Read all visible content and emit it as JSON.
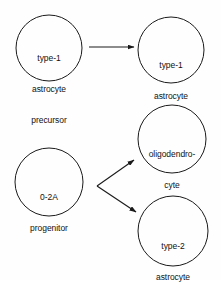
{
  "diagram": {
    "type": "cell-lineage-flow-diagram",
    "background_color": "#fefefe",
    "stroke_color": "#1a1a1a",
    "text_color": "#111111",
    "nodes": [
      {
        "id": "type-1-astrocyte-precursor",
        "label_lines": [
          "type-1",
          "astrocyte",
          "precursor"
        ],
        "line1": "type-1",
        "line2": "astrocyte",
        "line3": "precursor",
        "cx": 49,
        "cy": 48,
        "r": 33
      },
      {
        "id": "type-1-astrocyte",
        "label_lines": [
          "type-1",
          "astrocyte"
        ],
        "line1": "type-1",
        "line2": "astrocyte",
        "cx": 171,
        "cy": 50,
        "r": 33
      },
      {
        "id": "o-2a-progenitor",
        "label_lines": [
          "0-2A",
          "progenitor"
        ],
        "line1": "0-2A",
        "line2": "progenitor",
        "cx": 49,
        "cy": 182,
        "r": 34
      },
      {
        "id": "oligodendrocyte",
        "label_lines": [
          "oligodendro-",
          "cyte"
        ],
        "line1": "oligodendro-",
        "line2": "cyte",
        "cx": 172,
        "cy": 139,
        "r": 34
      },
      {
        "id": "type-2-astrocyte",
        "label_lines": [
          "type-2",
          "astrocyte"
        ],
        "line1": "type-2",
        "line2": "astrocyte",
        "cx": 173,
        "cy": 231,
        "r": 35
      }
    ],
    "edges": [
      {
        "id": "precursor-to-type-1-astrocyte",
        "from": "type-1-astrocyte-precursor",
        "to": "type-1-astrocyte",
        "x1": 89,
        "y1": 47,
        "x2": 134,
        "y2": 47
      },
      {
        "id": "progenitor-to-oligodendrocyte",
        "from": "o-2a-progenitor",
        "to": "oligodendrocyte",
        "x1": 97,
        "y1": 186,
        "x2": 134,
        "y2": 160
      },
      {
        "id": "progenitor-to-type-2-astrocyte",
        "from": "o-2a-progenitor",
        "to": "type-2-astrocyte",
        "x1": 97,
        "y1": 186,
        "x2": 136,
        "y2": 212
      }
    ]
  }
}
